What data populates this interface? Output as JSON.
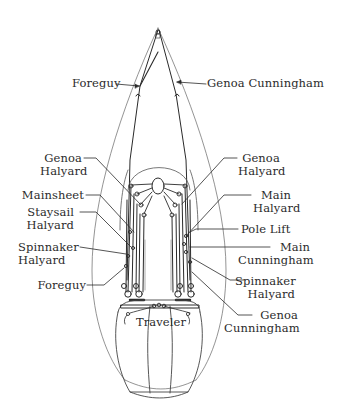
{
  "diagram": {
    "colors": {
      "line": "#2a2a2a",
      "thin_line": "#555555",
      "background": "#ffffff"
    },
    "labels": {
      "top_foreguy": {
        "line1": "Foreguy"
      },
      "top_genoa_cunningham": {
        "line1": "Genoa Cunningham"
      },
      "left_genoa_halyard": {
        "line1": "Genoa",
        "line2": "Halyard"
      },
      "left_mainsheet": {
        "line1": "Mainsheet"
      },
      "left_staysail_halyard": {
        "line1": "Staysail",
        "line2": "Halyard"
      },
      "left_spinnaker_halyard": {
        "line1": "Spinnaker",
        "line2": "Halyard"
      },
      "left_foreguy": {
        "line1": "Foreguy"
      },
      "right_genoa_halyard": {
        "line1": "Genoa",
        "line2": "Halyard"
      },
      "right_main_halyard": {
        "line1": "Main",
        "line2": "Halyard"
      },
      "right_pole_lift": {
        "line1": "Pole Lift"
      },
      "right_main_cunningham": {
        "line1": "Main",
        "line2": "Cunningham"
      },
      "right_spinnaker_halyard": {
        "line1": "Spinnaker",
        "line2": "Halyard"
      },
      "right_genoa_cunningham": {
        "line1": "Genoa",
        "line2": "Cunningham"
      },
      "traveler": {
        "line1": "Traveler"
      }
    }
  }
}
